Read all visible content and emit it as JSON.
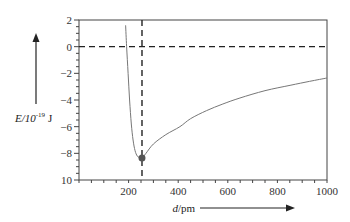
{
  "chart_data": {
    "type": "line",
    "title": "",
    "xlabel": "d/pm",
    "ylabel": "E/10^-19 J",
    "ylabel_parts": {
      "main": "E/10",
      "sup": "-19",
      "unit": " J"
    },
    "xlim": [
      0,
      1000
    ],
    "ylim": [
      -10,
      2
    ],
    "x_ticks": [
      200,
      400,
      600,
      800,
      1000
    ],
    "x_tick_labels": [
      "200",
      "400",
      "600",
      "800",
      "1000"
    ],
    "y_ticks": [
      2,
      0,
      -2,
      -4,
      -6,
      -8,
      -10
    ],
    "y_tick_labels": [
      "2",
      "0",
      "−2",
      "−4",
      "−6",
      "−8",
      "10"
    ],
    "x_minor_step": 50,
    "y_minor_step": 0.5,
    "grid": false,
    "legend": null,
    "series": [
      {
        "name": "potential energy curve",
        "color": "#777777",
        "x": [
          188,
          192,
          198,
          204,
          211,
          218,
          226,
          235,
          245,
          254,
          270,
          300,
          350,
          407,
          450,
          514,
          580,
          649,
          750,
          851,
          930,
          1000
        ],
        "y": [
          1.6,
          0.0,
          -2.0,
          -4.0,
          -5.8,
          -7.0,
          -7.8,
          -8.2,
          -8.33,
          -8.35,
          -8.0,
          -7.3,
          -6.6,
          -6.0,
          -5.4,
          -4.8,
          -4.3,
          -3.85,
          -3.3,
          -2.9,
          -2.6,
          -2.35
        ]
      }
    ],
    "annotations": [
      {
        "type": "hline",
        "y": 0,
        "style": "dashed",
        "color": "#222222"
      },
      {
        "type": "vline",
        "x": 254,
        "style": "dashed",
        "color": "#222222"
      },
      {
        "type": "point",
        "x": 254,
        "y": -8.35,
        "label": "minimum",
        "color": "#555555"
      }
    ]
  }
}
